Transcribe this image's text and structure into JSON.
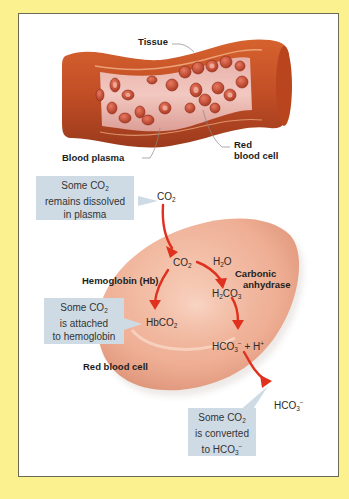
{
  "figure": {
    "background_color": "#fbf28f",
    "frame_color": "#ffffff",
    "callout_color": "#cfdbe4",
    "arrow_color": "#e0301e"
  },
  "vessel": {
    "labels": {
      "tissue": "Tissue",
      "blood_plasma": "Blood plasma",
      "red_blood_cell_line1": "Red",
      "red_blood_cell_line2": "blood cell"
    }
  },
  "cell": {
    "labels": {
      "hemoglobin": "Hemoglobin (Hb)",
      "carbonic_line1": "Carbonic",
      "carbonic_line2": "anhydrase",
      "red_blood_cell": "Red blood cell"
    }
  },
  "chemicals": {
    "co2_plasma": {
      "base": "CO",
      "sub": "2"
    },
    "co2_cell": {
      "base": "CO",
      "sub": "2"
    },
    "h2o": {
      "a": "H",
      "sub": "2",
      "b": "O"
    },
    "h2co3": {
      "a": "H",
      "sub1": "2",
      "b": "CO",
      "sub2": "3"
    },
    "hbco2": {
      "base": "HbCO",
      "sub": "2"
    },
    "hco3_h": {
      "a": "HCO",
      "sub": "3",
      "sup": "−",
      "b": " + H",
      "sup2": "+"
    },
    "hco3_out": {
      "a": "HCO",
      "sub": "3",
      "sup": "−"
    }
  },
  "callouts": {
    "dissolved": {
      "l1a": "Some CO",
      "l1sub": "2",
      "l2": "remains dissolved",
      "l3": "in plasma"
    },
    "attached": {
      "l1a": "Some CO",
      "l1sub": "2",
      "l2": "is attached",
      "l3": "to hemoglobin"
    },
    "converted": {
      "l1a": "Some CO",
      "l1sub": "2",
      "l2": "is converted",
      "l3a": "to HCO",
      "l3sub": "3",
      "l3sup": "−"
    }
  }
}
